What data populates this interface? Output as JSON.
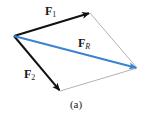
{
  "diagram": {
    "type": "parallelogram-vector-addition",
    "caption": "(a)",
    "colors": {
      "force": "#111111",
      "resultant": "#3b82d0",
      "construction": "#a0a0a0"
    },
    "points": {
      "origin": [
        14,
        36
      ],
      "f1_tip": [
        90,
        13
      ],
      "f2_tip": [
        60,
        91
      ],
      "fr_tip": [
        137,
        68
      ]
    },
    "vectors": [
      {
        "id": "F1",
        "label_main": "F",
        "label_sub": "1",
        "from": "origin",
        "to": "f1_tip",
        "color": "#111111"
      },
      {
        "id": "F2",
        "label_main": "F",
        "label_sub": "2",
        "from": "origin",
        "to": "f2_tip",
        "color": "#111111"
      },
      {
        "id": "FR",
        "label_main": "F",
        "label_sub": "R",
        "from": "origin",
        "to": "fr_tip",
        "color": "#3b82d0"
      }
    ],
    "construction_lines": [
      {
        "from": "f1_tip",
        "to": "fr_tip"
      },
      {
        "from": "f2_tip",
        "to": "fr_tip"
      }
    ]
  }
}
